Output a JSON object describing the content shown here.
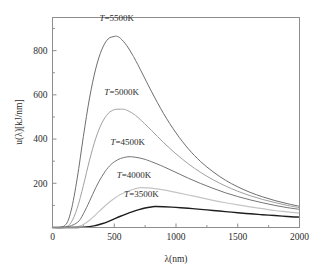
{
  "chart_data": {
    "type": "line",
    "title": "",
    "xlabel": "λ(nm)",
    "ylabel": "u(λ)[kJ/nm]",
    "xlim": [
      0,
      2000
    ],
    "ylim": [
      0,
      950
    ],
    "xticks": [
      0,
      500,
      1000,
      1500,
      2000
    ],
    "xtick_labels": [
      "0",
      "500",
      "1000",
      "1500",
      "2000"
    ],
    "yticks": [
      200,
      400,
      600,
      800
    ],
    "ytick_labels": [
      "200",
      "400",
      "600",
      "800"
    ],
    "x_minor_step": 250,
    "y_minor_step": 100,
    "grid": false,
    "legend": "inline-annotations",
    "series": [
      {
        "name": "T=5500K",
        "temperature_K": 5500,
        "color": "#6e6e6e",
        "stroke_width": 1.0,
        "peak_x": 520,
        "peak_y": 865,
        "label": "T=5500K",
        "label_prefix": "T",
        "label_suffix": "=5500K",
        "label_x": 520,
        "label_y": 935,
        "x": [
          0,
          100,
          150,
          200,
          250,
          300,
          350,
          400,
          450,
          500,
          520,
          550,
          600,
          650,
          700,
          800,
          900,
          1000,
          1100,
          1200,
          1300,
          1400,
          1500,
          1600,
          1700,
          1800,
          1900,
          2000
        ],
        "y": [
          0,
          9,
          75,
          222,
          412,
          586,
          718,
          806,
          853,
          864,
          865,
          856,
          824,
          779,
          727,
          617,
          515,
          428,
          356,
          298,
          252,
          214,
          184,
          159,
          139,
          122,
          108,
          96
        ]
      },
      {
        "name": "T=5000K",
        "temperature_K": 5000,
        "color": "#a0a0a0",
        "stroke_width": 1.0,
        "peak_x": 575,
        "peak_y": 535,
        "label": "T=5000K",
        "label_prefix": "T",
        "label_suffix": "=5000K",
        "label_x": 560,
        "label_y": 600,
        "x": [
          0,
          100,
          150,
          200,
          250,
          300,
          350,
          400,
          450,
          500,
          550,
          575,
          600,
          650,
          700,
          800,
          900,
          1000,
          1100,
          1200,
          1300,
          1400,
          1500,
          1600,
          1700,
          1800,
          1900,
          2000
        ],
        "y": [
          0,
          2,
          22,
          87,
          190,
          305,
          403,
          473,
          515,
          533,
          535,
          535,
          531,
          516,
          494,
          440,
          384,
          333,
          288,
          249,
          216,
          188,
          164,
          144,
          127,
          113,
          100,
          90
        ]
      },
      {
        "name": "T=4500K",
        "temperature_K": 4500,
        "color": "#747474",
        "stroke_width": 1.0,
        "peak_x": 640,
        "peak_y": 320,
        "label": "T=4500K",
        "label_prefix": "T",
        "label_suffix": "=4500K",
        "label_x": 610,
        "label_y": 372,
        "x": [
          0,
          100,
          200,
          250,
          300,
          350,
          400,
          450,
          500,
          550,
          600,
          640,
          700,
          750,
          800,
          900,
          1000,
          1100,
          1200,
          1300,
          1400,
          1500,
          1600,
          1700,
          1800,
          1900,
          2000
        ],
        "y": [
          0,
          0,
          22,
          62,
          119,
          180,
          231,
          271,
          297,
          312,
          319,
          320,
          315,
          308,
          298,
          275,
          249,
          223,
          199,
          177,
          157,
          140,
          125,
          112,
          100,
          90,
          82
        ]
      },
      {
        "name": "T=4000K",
        "temperature_K": 4000,
        "color": "#c4c4c4",
        "stroke_width": 1.2,
        "peak_x": 720,
        "peak_y": 180,
        "label": "T=4000K",
        "label_prefix": "T",
        "label_suffix": "=4000K",
        "label_x": 660,
        "label_y": 225,
        "x": [
          0,
          100,
          200,
          250,
          300,
          350,
          400,
          450,
          500,
          550,
          600,
          650,
          700,
          720,
          800,
          900,
          1000,
          1100,
          1200,
          1300,
          1400,
          1500,
          1600,
          1700,
          1800,
          1900,
          2000
        ],
        "y": [
          0,
          0,
          4,
          14,
          33,
          58,
          85,
          110,
          131,
          149,
          162,
          172,
          179,
          180,
          178,
          170,
          159,
          147,
          135,
          123,
          112,
          102,
          93,
          85,
          77,
          71,
          65
        ]
      },
      {
        "name": "T=3500K",
        "temperature_K": 3500,
        "color": "#1e1e1e",
        "stroke_width": 1.4,
        "peak_x": 830,
        "peak_y": 95,
        "label": "T=3500K",
        "label_prefix": "T",
        "label_suffix": "=3500K",
        "label_x": 720,
        "label_y": 140,
        "x": [
          0,
          100,
          200,
          300,
          350,
          400,
          450,
          500,
          550,
          600,
          650,
          700,
          750,
          800,
          830,
          900,
          1000,
          1100,
          1200,
          1300,
          1400,
          1500,
          1600,
          1700,
          1800,
          1900,
          2000
        ],
        "y": [
          0,
          0,
          0,
          4,
          9,
          17,
          27,
          39,
          51,
          62,
          72,
          81,
          88,
          93,
          95,
          94,
          91,
          87,
          82,
          77,
          72,
          67,
          62,
          58,
          54,
          50,
          47
        ]
      }
    ]
  }
}
